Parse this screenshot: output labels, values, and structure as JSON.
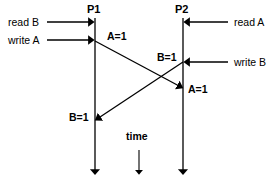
{
  "diagram": {
    "type": "sequence-timing-diagram",
    "background_color": "#ffffff",
    "line_color": "#000000",
    "processes": [
      {
        "id": "p1",
        "label": "P1",
        "x": 95,
        "top": 18,
        "bottom": 178
      },
      {
        "id": "p2",
        "label": "P2",
        "x": 183,
        "top": 18,
        "bottom": 178
      }
    ],
    "time_axis": {
      "label": "time",
      "x": 139,
      "arrow_top": 150,
      "arrow_bottom": 178
    },
    "left_events": [
      {
        "id": "read-b",
        "label": "read B",
        "y": 22,
        "target_x": 95
      },
      {
        "id": "write-a",
        "label": "write A",
        "y": 40,
        "target_x": 95
      }
    ],
    "right_events": [
      {
        "id": "read-a",
        "label": "read A",
        "y": 22,
        "target_x": 183
      },
      {
        "id": "write-b",
        "label": "write B",
        "y": 62,
        "target_x": 183
      }
    ],
    "messages": [
      {
        "id": "a-equals-1",
        "label": "A=1",
        "from": {
          "x": 95,
          "y": 41
        },
        "to": {
          "x": 183,
          "y": 88
        },
        "label_near_source": "A=1",
        "label_near_target": "A=1"
      },
      {
        "id": "b-equals-1",
        "label": "B=1",
        "from": {
          "x": 183,
          "y": 62
        },
        "to": {
          "x": 95,
          "y": 120
        },
        "label_near_source": "B=1",
        "label_near_target": "B=1"
      }
    ],
    "value_labels": [
      {
        "id": "a1-source",
        "text": "A=1",
        "x": 107,
        "y": 36
      },
      {
        "id": "b1-source",
        "text": "B=1",
        "x": 158,
        "y": 57
      },
      {
        "id": "a1-target",
        "text": "A=1",
        "x": 188,
        "y": 88
      },
      {
        "id": "b1-target",
        "text": "B=1",
        "x": 70,
        "y": 116
      }
    ]
  }
}
